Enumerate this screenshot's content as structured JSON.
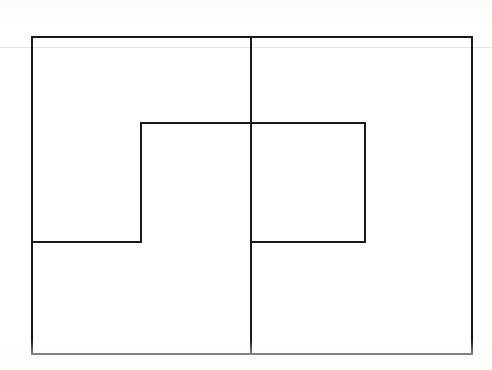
{
  "figure": {
    "background_color": "#ffffff",
    "stroke_color": "#1a1a1a",
    "stroke_width": 2,
    "canvas": {
      "width": 492,
      "height": 370
    },
    "paths": [
      {
        "name": "outer-rectangle",
        "kind": "rect",
        "x": 32,
        "y": 37,
        "width": 440,
        "height": 317
      },
      {
        "name": "center-vertical-divider",
        "kind": "line",
        "x1": 251,
        "y1": 37,
        "x2": 251,
        "y2": 354
      },
      {
        "name": "inner-step-top-edge",
        "kind": "line",
        "x1": 141,
        "y1": 123,
        "x2": 365,
        "y2": 123
      },
      {
        "name": "inner-step-right-edge",
        "kind": "line",
        "x1": 365,
        "y1": 123,
        "x2": 365,
        "y2": 242
      },
      {
        "name": "inner-step-bottom-right-edge",
        "kind": "line",
        "x1": 365,
        "y1": 242,
        "x2": 251,
        "y2": 242
      },
      {
        "name": "inner-step-left-edge",
        "kind": "line",
        "x1": 141,
        "y1": 123,
        "x2": 141,
        "y2": 242
      },
      {
        "name": "inner-step-bottom-left-edge",
        "kind": "line",
        "x1": 141,
        "y1": 242,
        "x2": 32,
        "y2": 242
      }
    ],
    "scan_artifacts": [
      {
        "name": "faint-horizontal-scanline",
        "x": 0,
        "y": 47,
        "width": 492
      }
    ]
  }
}
